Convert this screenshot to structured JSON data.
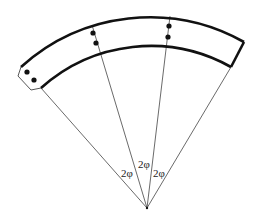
{
  "diagram": {
    "labels": [
      "2φ",
      "2φ",
      "2φ"
    ],
    "colors": {
      "stroke": "#111111",
      "thin": "#444444",
      "background": "#ffffff"
    }
  }
}
